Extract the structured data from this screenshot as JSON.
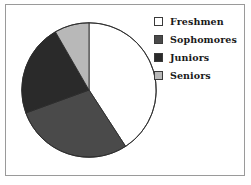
{
  "figure": {
    "background": "#ffffff",
    "border_color": "#9a9a9a"
  },
  "chart_data": {
    "type": "pie",
    "title": "",
    "categories": [
      "Freshmen",
      "Sophomores",
      "Juniors",
      "Seniors"
    ],
    "values": [
      41,
      29,
      22,
      8
    ],
    "unit": "percent",
    "start_angle_deg": 0,
    "direction": "clockwise",
    "slice_colors": [
      "#ffffff",
      "#4a4a4a",
      "#2a2a2a",
      "#b8b8b8"
    ],
    "slice_edge_color": "#2b2b2b",
    "legend_position": "right",
    "grid": false,
    "slices": [
      {
        "label": "Freshmen",
        "value": 41,
        "color": "#ffffff",
        "start_deg": 0,
        "end_deg": 147
      },
      {
        "label": "Sophomores",
        "value": 29,
        "color": "#4a4a4a",
        "start_deg": 147,
        "end_deg": 250
      },
      {
        "label": "Juniors",
        "value": 22,
        "color": "#2a2a2a",
        "start_deg": 250,
        "end_deg": 330
      },
      {
        "label": "Seniors",
        "value": 8,
        "color": "#b8b8b8",
        "start_deg": 330,
        "end_deg": 360
      }
    ]
  },
  "legend": {
    "items": [
      {
        "label": "Freshmen",
        "color": "#ffffff"
      },
      {
        "label": "Sophomores",
        "color": "#4a4a4a"
      },
      {
        "label": "Juniors",
        "color": "#2a2a2a"
      },
      {
        "label": "Seniors",
        "color": "#b8b8b8"
      }
    ]
  }
}
